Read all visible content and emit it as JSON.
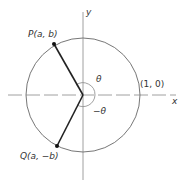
{
  "diagram": {
    "type": "unit-circle-reflection",
    "axes": {
      "x_label": "x",
      "y_label": "y"
    },
    "points": [
      {
        "id": "P",
        "label": "P(a, b)"
      },
      {
        "id": "Q",
        "label": "Q(a, −b)"
      },
      {
        "id": "unit",
        "label": "(1, 0)"
      }
    ],
    "angles": [
      {
        "label": "θ"
      },
      {
        "label": "−θ"
      }
    ],
    "colors": {
      "line": "#222222",
      "circle": "#777777",
      "axis": "#888888"
    }
  }
}
